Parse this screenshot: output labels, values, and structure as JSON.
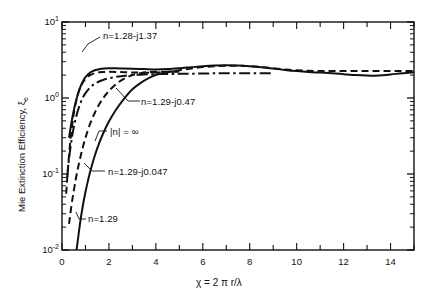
{
  "chart_data": {
    "type": "line",
    "title": "",
    "xlabel": "χ = 2 π r/λ",
    "ylabel": "Mie Extinction Efficiency,  ξ",
    "ylabel_sub": "e",
    "xscale": "linear",
    "yscale": "log",
    "xlim": [
      0,
      15
    ],
    "ylim": [
      0.01,
      10
    ],
    "grid": false,
    "legend": "inline-annotations",
    "xticks": [
      0,
      1,
      2,
      3,
      4,
      5,
      6,
      7,
      8,
      9,
      10,
      11,
      12,
      13,
      14,
      15
    ],
    "xticklabels": [
      "0",
      "",
      "2",
      "",
      "4",
      "",
      "6",
      "",
      "8",
      "",
      "10",
      "",
      "12",
      "",
      "14",
      ""
    ],
    "yticks": [
      0.01,
      0.1,
      1,
      10
    ],
    "yticklabels": [
      "10",
      "10",
      "10",
      "10"
    ],
    "yticklabel_exponents": [
      "-2",
      "-1",
      "0",
      "1"
    ],
    "series": [
      {
        "name": "n=1.28-j1.37",
        "style": "solid",
        "label": "n=1.28-j1.37",
        "x": [
          0.3,
          0.4,
          0.5,
          0.6,
          0.7,
          0.8,
          0.9,
          1.0,
          1.2,
          1.4,
          1.6,
          1.8,
          2.0,
          2.3,
          2.6,
          3.0,
          3.5,
          4.0,
          4.5,
          5.0,
          5.5,
          6.0,
          6.5,
          7.0,
          7.5,
          8.0,
          8.5,
          9.0,
          9.5,
          10.0,
          10.5,
          11.0,
          11.5,
          12.0,
          12.5,
          13.0,
          13.5,
          14.0,
          14.5,
          15.0
        ],
        "y": [
          0.3,
          0.47,
          0.68,
          0.92,
          1.18,
          1.44,
          1.68,
          1.88,
          2.16,
          2.32,
          2.4,
          2.44,
          2.46,
          2.46,
          2.44,
          2.42,
          2.4,
          2.38,
          2.4,
          2.46,
          2.54,
          2.62,
          2.68,
          2.7,
          2.68,
          2.62,
          2.54,
          2.44,
          2.34,
          2.26,
          2.2,
          2.16,
          2.12,
          2.06,
          2.0,
          1.97,
          1.98,
          2.04,
          2.12,
          2.18
        ]
      },
      {
        "name": "n=1.29-j0.47",
        "style": "dashdot",
        "label": "n=1.29-j0.47",
        "x": [
          0.22,
          0.3,
          0.4,
          0.5,
          0.6,
          0.7,
          0.8,
          0.9,
          1.0,
          1.2,
          1.4,
          1.6,
          1.8,
          2.0,
          2.3,
          2.6,
          3.0,
          3.5,
          4.0,
          4.5,
          5.0,
          5.5,
          6.0,
          6.5,
          7.0,
          7.5,
          8.0,
          8.5,
          9.0
        ],
        "y": [
          0.09,
          0.16,
          0.27,
          0.41,
          0.56,
          0.72,
          0.88,
          1.03,
          1.16,
          1.38,
          1.54,
          1.66,
          1.75,
          1.82,
          1.9,
          1.95,
          2.0,
          2.04,
          2.06,
          2.07,
          2.08,
          2.09,
          2.1,
          2.11,
          2.11,
          2.11,
          2.11,
          2.11,
          2.11
        ]
      },
      {
        "name": "|n| = ∞",
        "style": "dashed",
        "label": "|n| = ∞",
        "x": [
          0.18,
          0.22,
          0.26,
          0.3,
          0.35,
          0.4,
          0.45,
          0.5,
          0.6,
          0.7,
          0.8,
          0.9,
          1.0,
          1.2,
          1.4,
          1.6,
          1.8,
          2.0,
          2.4,
          2.8,
          3.2,
          3.6,
          4.0,
          4.5,
          5.0,
          5.5,
          6.0,
          6.5,
          7.0,
          7.5,
          8.0,
          8.5,
          9.0,
          9.5,
          10.0,
          10.5,
          11.0,
          11.5,
          12.0,
          12.5,
          13.0,
          13.5,
          14.0,
          14.5,
          15.0
        ],
        "y": [
          0.055,
          0.085,
          0.125,
          0.175,
          0.26,
          0.36,
          0.48,
          0.62,
          0.9,
          1.18,
          1.42,
          1.62,
          1.78,
          2.0,
          2.12,
          2.18,
          2.2,
          2.21,
          2.2,
          2.18,
          2.16,
          2.15,
          2.16,
          2.22,
          2.32,
          2.44,
          2.55,
          2.62,
          2.66,
          2.66,
          2.62,
          2.55,
          2.46,
          2.38,
          2.32,
          2.28,
          2.26,
          2.26,
          2.26,
          2.26,
          2.26,
          2.26,
          2.26,
          2.26,
          2.26
        ]
      },
      {
        "name": "n=1.29-j0.047",
        "style": "dashed",
        "label": "n=1.29-j0.047",
        "x": [
          0.3,
          0.4,
          0.5,
          0.6,
          0.7,
          0.8,
          0.9,
          1.0,
          1.2,
          1.4,
          1.6,
          1.8,
          2.0,
          2.3,
          2.6,
          3.0,
          3.4,
          3.8,
          4.2,
          4.6,
          5.0
        ],
        "y": [
          0.022,
          0.038,
          0.06,
          0.09,
          0.128,
          0.175,
          0.232,
          0.3,
          0.46,
          0.64,
          0.84,
          1.04,
          1.24,
          1.52,
          1.76,
          2.0,
          2.14,
          2.2,
          2.22,
          2.22,
          2.22
        ]
      },
      {
        "name": "n=1.29",
        "style": "solid",
        "label": "n=1.29",
        "x": [
          0.62,
          0.7,
          0.8,
          0.9,
          1.0,
          1.1,
          1.2,
          1.4,
          1.6,
          1.8,
          2.0,
          2.3,
          2.6,
          3.0,
          3.4,
          3.8,
          4.2,
          4.6,
          5.0
        ],
        "y": [
          0.01,
          0.0155,
          0.026,
          0.04,
          0.058,
          0.08,
          0.107,
          0.175,
          0.262,
          0.368,
          0.49,
          0.7,
          0.94,
          1.3,
          1.62,
          1.9,
          2.1,
          2.22,
          2.28
        ]
      }
    ],
    "annotations": [
      {
        "text": "n=1.28-j1.37",
        "series": "n=1.28-j1.37"
      },
      {
        "text": "n=1.29-j0.47",
        "series": "n=1.29-j0.47"
      },
      {
        "text": "|n| = ∞",
        "series": "|n| = ∞"
      },
      {
        "text": "n=1.29-j0.047",
        "series": "n=1.29-j0.047"
      },
      {
        "text": "n=1.29",
        "series": "n=1.29"
      }
    ]
  }
}
